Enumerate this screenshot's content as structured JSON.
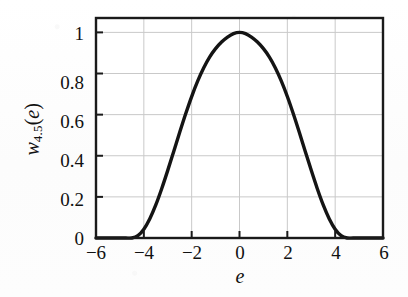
{
  "chart_data": {
    "type": "line",
    "title": "",
    "subtitle": "",
    "xlabel": "e",
    "ylabel": "w4.5(e)",
    "ylabel_parts": {
      "symbol": "w",
      "subscript": "4.5",
      "argument": "(e)"
    },
    "xlim": [
      -6,
      6
    ],
    "ylim": [
      0,
      1.07
    ],
    "xticks": [
      -6,
      -4,
      -2,
      0,
      2,
      4,
      6
    ],
    "xticklabels": [
      "−6",
      "−4",
      "−2",
      "0",
      "2",
      "4",
      "6"
    ],
    "yticks": [
      0,
      0.2,
      0.4,
      0.6,
      0.8,
      1
    ],
    "yticklabels": [
      "0",
      "0.2",
      "0.4",
      "0.6",
      "0.8",
      "1"
    ],
    "grid": true,
    "grid_color": "#c9c9c9",
    "legend": null,
    "line_color": "#141414",
    "line_width": 3.4,
    "support": [
      -4.5,
      4.5
    ],
    "peak_x": 0,
    "peak_y": 1,
    "series": [
      {
        "name": "w4.5(e)",
        "x": [
          -6.0,
          -5.5,
          -5.0,
          -4.75,
          -4.5,
          -4.25,
          -4.0,
          -3.75,
          -3.5,
          -3.25,
          -3.0,
          -2.75,
          -2.5,
          -2.25,
          -2.0,
          -1.75,
          -1.5,
          -1.25,
          -1.0,
          -0.75,
          -0.5,
          -0.25,
          0.0,
          0.25,
          0.5,
          0.75,
          1.0,
          1.25,
          1.5,
          1.75,
          2.0,
          2.25,
          2.5,
          2.75,
          3.0,
          3.25,
          3.5,
          3.75,
          4.0,
          4.25,
          4.5,
          4.75,
          5.0,
          5.5,
          6.0
        ],
        "y": [
          0.0,
          0.0,
          0.0,
          0.0,
          0.0,
          0.011,
          0.043,
          0.094,
          0.161,
          0.241,
          0.329,
          0.421,
          0.514,
          0.604,
          0.688,
          0.763,
          0.827,
          0.88,
          0.921,
          0.953,
          0.977,
          0.994,
          1.0,
          0.994,
          0.977,
          0.953,
          0.921,
          0.88,
          0.827,
          0.763,
          0.688,
          0.604,
          0.514,
          0.421,
          0.329,
          0.241,
          0.161,
          0.094,
          0.043,
          0.011,
          0.0,
          0.0,
          0.0,
          0.0,
          0.0
        ]
      }
    ]
  },
  "axes": {
    "frame_color": "#1a1a1a",
    "background": "#ffffff"
  }
}
